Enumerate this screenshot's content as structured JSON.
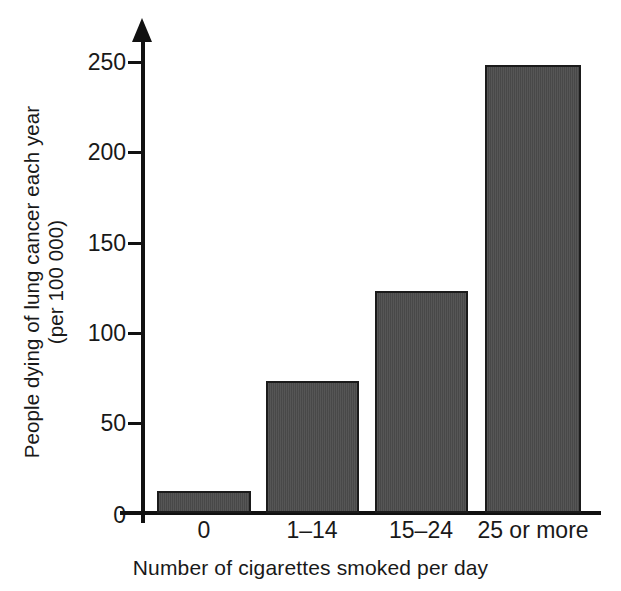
{
  "chart_data": {
    "type": "bar",
    "title": "",
    "subtitle": "",
    "xlabel": "Number of cigarettes smoked per day",
    "ylabel": "People dying of lung cancer each year (per 100 000)",
    "ylabel_lines": [
      "People dying of lung cancer each year",
      "(per 100 000)"
    ],
    "categories": [
      "0",
      "1–14",
      "15–24",
      "25 or more"
    ],
    "values": [
      12,
      73,
      123,
      248
    ],
    "ylim": [
      0,
      250
    ],
    "y_ticks": [
      0,
      50,
      100,
      150,
      200,
      250
    ],
    "y_tick_labels": [
      "0",
      "50",
      "100",
      "150",
      "200",
      "250"
    ],
    "grid": false,
    "legend": null,
    "bar_color": "#4c4c4c",
    "bar_border_color": "#1b1b1b",
    "axis_color": "#111111",
    "background_color": "#ffffff",
    "y_axis_arrow": true
  },
  "axes": {
    "y_title_line_1": "People dying of lung cancer each year",
    "y_title_line_2": "(per 100 000)",
    "x_title": "Number of cigarettes smoked per day"
  },
  "y_tick_labels": {
    "t0": "0",
    "t1": "50",
    "t2": "100",
    "t3": "150",
    "t4": "200",
    "t5": "250"
  },
  "x_tick_labels": {
    "c0": "0",
    "c1": "1–14",
    "c2": "15–24",
    "c3": "25 or more"
  }
}
